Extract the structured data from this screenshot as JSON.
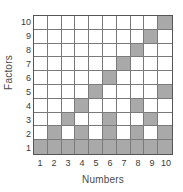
{
  "chart_data": {
    "type": "heatmap",
    "title": "",
    "xlabel": "Numbers",
    "ylabel": "Factors",
    "x": [
      1,
      2,
      3,
      4,
      5,
      6,
      7,
      8,
      9,
      10
    ],
    "y": [
      1,
      2,
      3,
      4,
      5,
      6,
      7,
      8,
      9,
      10
    ],
    "xticklabels": [
      "1",
      "2",
      "3",
      "4",
      "5",
      "6",
      "7",
      "8",
      "9",
      "10"
    ],
    "yticklabels_top_to_bottom": [
      "10",
      "9",
      "8",
      "7",
      "6",
      "5",
      "4",
      "3",
      "2",
      "1"
    ],
    "xlim": [
      1,
      10
    ],
    "ylim": [
      1,
      10
    ],
    "grid": true,
    "legend": null,
    "filled_color": "#a9a9a9",
    "empty_color": "#ffffff",
    "grid_line_color": "#7a7a7a",
    "border_color": "#555555",
    "rows_top_to_bottom": [
      {
        "factor": 10,
        "values": [
          0,
          0,
          0,
          0,
          0,
          0,
          0,
          0,
          0,
          1
        ]
      },
      {
        "factor": 9,
        "values": [
          0,
          0,
          0,
          0,
          0,
          0,
          0,
          0,
          1,
          0
        ]
      },
      {
        "factor": 8,
        "values": [
          0,
          0,
          0,
          0,
          0,
          0,
          0,
          1,
          0,
          0
        ]
      },
      {
        "factor": 7,
        "values": [
          0,
          0,
          0,
          0,
          0,
          0,
          1,
          0,
          0,
          0
        ]
      },
      {
        "factor": 6,
        "values": [
          0,
          0,
          0,
          0,
          0,
          1,
          0,
          0,
          0,
          0
        ]
      },
      {
        "factor": 5,
        "values": [
          0,
          0,
          0,
          0,
          1,
          0,
          0,
          0,
          0,
          1
        ]
      },
      {
        "factor": 4,
        "values": [
          0,
          0,
          0,
          1,
          0,
          0,
          0,
          1,
          0,
          0
        ]
      },
      {
        "factor": 3,
        "values": [
          0,
          0,
          1,
          0,
          0,
          1,
          0,
          0,
          1,
          0
        ]
      },
      {
        "factor": 2,
        "values": [
          0,
          1,
          0,
          1,
          0,
          1,
          0,
          1,
          0,
          1
        ]
      },
      {
        "factor": 1,
        "values": [
          1,
          1,
          1,
          1,
          1,
          1,
          1,
          1,
          1,
          1
        ]
      }
    ]
  }
}
